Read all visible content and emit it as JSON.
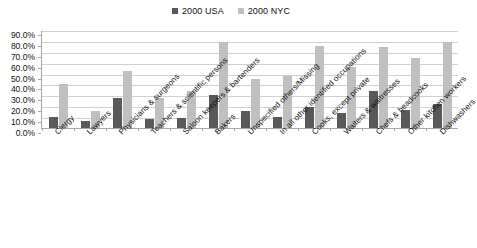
{
  "chart_data": {
    "type": "bar",
    "title": "",
    "xlabel": "",
    "ylabel": "",
    "ylim": [
      0,
      90
    ],
    "grid": true,
    "legend_position": "top-center",
    "y_ticks": [
      "90.0%",
      "80.0%",
      "70.0%",
      "60.0%",
      "50.0%",
      "40.0%",
      "30.0%",
      "20.0%",
      "10.0%",
      "0.0%"
    ],
    "categories": [
      "Clergy",
      "Lawyers",
      "Physicians & surgeons",
      "Teachers & scientific persons",
      "Saloon keepers & bartenders",
      "Bakers",
      "Unspecified others/Missing",
      "In all other identified occupations",
      "Cooks, except private",
      "Waiters & waitresses",
      "Chefs & headcooks",
      "Other kitchen workers",
      "Dishwashers"
    ],
    "series": [
      {
        "name": "2000 USA",
        "color": "#595959",
        "values": [
          10.0,
          6.0,
          28.0,
          8.0,
          9.0,
          30.0,
          16.0,
          10.0,
          19.0,
          14.0,
          34.0,
          17.0,
          22.0
        ]
      },
      {
        "name": "2000 NYC",
        "color": "#bfbfbf",
        "values": [
          40.0,
          16.0,
          52.0,
          28.0,
          34.0,
          79.0,
          45.0,
          48.0,
          75.0,
          56.0,
          74.0,
          64.0,
          79.0
        ]
      }
    ]
  }
}
